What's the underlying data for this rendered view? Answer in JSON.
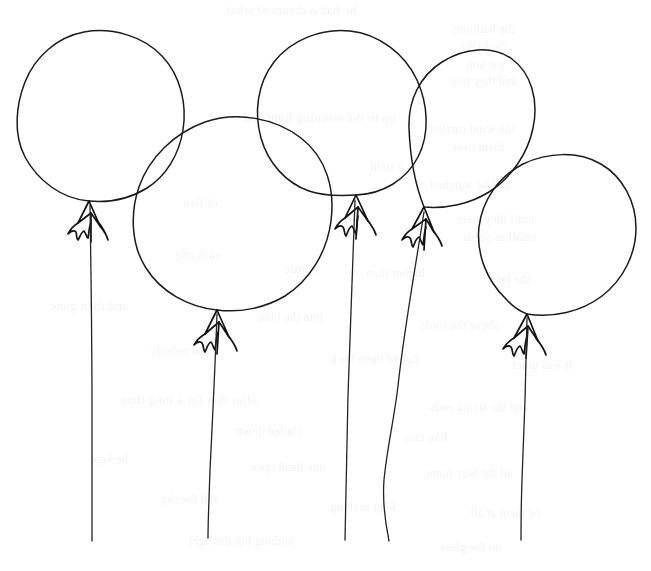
{
  "artwork": {
    "title": "Five Balloons",
    "medium": "pen-and-ink line drawing",
    "paper_color": "#ffffff",
    "ink_color": "#1b1b1f",
    "width": 651,
    "height": 571,
    "subject_count": 5
  },
  "balloons": [
    {
      "id": "balloon-1",
      "label": "Balloon 1",
      "center_x": 101,
      "center_y": 116,
      "radius_x": 84,
      "radius_y": 85,
      "knot_x": 89,
      "knot_y": 201,
      "string_end_x": 92,
      "string_end_y": 541
    },
    {
      "id": "balloon-2",
      "label": "Balloon 2",
      "center_x": 232,
      "center_y": 212,
      "radius_x": 100,
      "radius_y": 98,
      "knot_x": 217,
      "knot_y": 310,
      "string_end_x": 208,
      "string_end_y": 538
    },
    {
      "id": "balloon-3",
      "label": "Balloon 3",
      "center_x": 341,
      "center_y": 112,
      "radius_x": 86,
      "radius_y": 83,
      "knot_x": 356,
      "knot_y": 195,
      "string_end_x": 345,
      "string_end_y": 540
    },
    {
      "id": "balloon-4",
      "label": "Balloon 4",
      "center_x": 484,
      "center_y": 131,
      "radius_x": 72,
      "radius_y": 79,
      "knot_x": 424,
      "knot_y": 207,
      "string_end_x": 389,
      "string_end_y": 541
    },
    {
      "id": "balloon-5",
      "label": "Balloon 5",
      "center_x": 557,
      "center_y": 237,
      "radius_x": 79,
      "radius_y": 82,
      "knot_x": 527,
      "knot_y": 314,
      "string_end_x": 521,
      "string_end_y": 540
    }
  ],
  "ghost_text": {
    "note": "faint ink show-through from the reverse side of the page",
    "lines": [
      {
        "text": "he had a dream of what",
        "x": 226,
        "y": 2,
        "size": 13
      },
      {
        "text": "the balloons",
        "x": 452,
        "y": 22,
        "size": 12
      },
      {
        "text": "could do",
        "x": 462,
        "y": 40,
        "size": 12
      },
      {
        "text": "for him",
        "x": 466,
        "y": 58,
        "size": 12
      },
      {
        "text": "and they rose",
        "x": 448,
        "y": 74,
        "size": 12
      },
      {
        "text": "up in the morning light and",
        "x": 243,
        "y": 110,
        "size": 13
      },
      {
        "text": "the wind carried",
        "x": 430,
        "y": 122,
        "size": 12
      },
      {
        "text": "them over",
        "x": 452,
        "y": 140,
        "size": 12
      },
      {
        "text": "a field",
        "x": 370,
        "y": 160,
        "size": 12
      },
      {
        "text": "and he watched",
        "x": 430,
        "y": 178,
        "size": 12
      },
      {
        "text": "of five",
        "x": 183,
        "y": 196,
        "size": 12
      },
      {
        "text": "until they were",
        "x": 456,
        "y": 212,
        "size": 12
      },
      {
        "text": "small as seeds",
        "x": 463,
        "y": 230,
        "size": 12
      },
      {
        "text": "each one",
        "x": 175,
        "y": 248,
        "size": 12
      },
      {
        "text": "a little",
        "x": 284,
        "y": 262,
        "size": 12
      },
      {
        "text": "higher than",
        "x": 366,
        "y": 266,
        "size": 12
      },
      {
        "text": "the last",
        "x": 492,
        "y": 272,
        "size": 12
      },
      {
        "text": "and then gone",
        "x": 50,
        "y": 298,
        "size": 13
      },
      {
        "text": "into the blue",
        "x": 258,
        "y": 310,
        "size": 12
      },
      {
        "text": "above the roofs",
        "x": 420,
        "y": 318,
        "size": 12
      },
      {
        "text": "and nobody",
        "x": 150,
        "y": 344,
        "size": 12
      },
      {
        "text": "called them back",
        "x": 330,
        "y": 352,
        "size": 12
      },
      {
        "text": "it was quiet",
        "x": 512,
        "y": 358,
        "size": 12
      },
      {
        "text": "after that for a long time",
        "x": 120,
        "y": 392,
        "size": 13
      },
      {
        "text": "and the string ends",
        "x": 430,
        "y": 400,
        "size": 12
      },
      {
        "text": "trailed down",
        "x": 236,
        "y": 424,
        "size": 12
      },
      {
        "text": "like rain",
        "x": 404,
        "y": 430,
        "size": 12
      },
      {
        "text": "he kept",
        "x": 90,
        "y": 452,
        "size": 12
      },
      {
        "text": "one hand open",
        "x": 250,
        "y": 460,
        "size": 12
      },
      {
        "text": "all the way home",
        "x": 424,
        "y": 466,
        "size": 12
      },
      {
        "text": "and the sky",
        "x": 160,
        "y": 492,
        "size": 12
      },
      {
        "text": "kept nothing",
        "x": 330,
        "y": 500,
        "size": 12
      },
      {
        "text": "of them at all",
        "x": 470,
        "y": 506,
        "size": 12
      },
      {
        "text": "nothing but the light",
        "x": 188,
        "y": 534,
        "size": 12
      },
      {
        "text": "on the glass",
        "x": 440,
        "y": 540,
        "size": 12
      }
    ]
  }
}
